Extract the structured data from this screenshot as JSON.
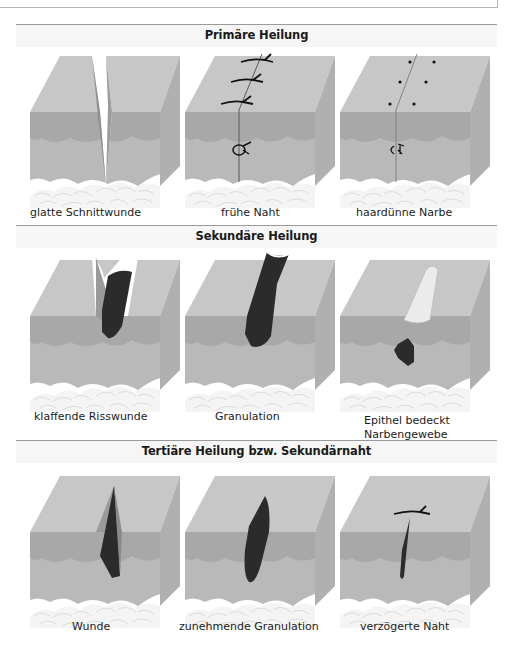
{
  "sections": [
    {
      "title": "Primäre Heilung",
      "panels": [
        {
          "caption": "glatte Schnittwunde",
          "illustration": "clean-incision"
        },
        {
          "caption": "frühe Naht",
          "illustration": "early-suture"
        },
        {
          "caption": "haardünne Narbe",
          "illustration": "thin-scar"
        }
      ]
    },
    {
      "title": "Sekundäre Heilung",
      "panels": [
        {
          "caption": "klaffende Risswunde",
          "illustration": "gaping-laceration"
        },
        {
          "caption": "Granulation",
          "illustration": "granulation"
        },
        {
          "caption": "Epithel bedeckt\nNarbengewebe",
          "illustration": "epithelium-covers-scar"
        }
      ]
    },
    {
      "title": "Tertiäre Heilung bzw. Sekundärnaht",
      "panels": [
        {
          "caption": "Wunde",
          "illustration": "wound"
        },
        {
          "caption": "zunehmende Granulation",
          "illustration": "increasing-granulation"
        },
        {
          "caption": "verzögerte Naht",
          "illustration": "delayed-suture"
        }
      ]
    }
  ],
  "colors": {
    "epidermis_top": "#c4c4c4",
    "epidermis_side": "#a9a9a9",
    "dermis": "#b7b7b7",
    "subcutis_cells": "#f2f2f2",
    "wound_tissue": "#2e2e2e",
    "rule": "#9a9a9a"
  }
}
